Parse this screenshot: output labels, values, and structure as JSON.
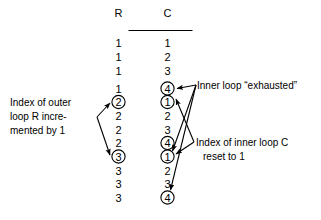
{
  "figure": {
    "table": {
      "headers": [
        "R",
        "C"
      ],
      "rows": [
        {
          "r": "1",
          "c": "1",
          "r_circled": false,
          "c_circled": false
        },
        {
          "r": "1",
          "c": "2",
          "r_circled": false,
          "c_circled": false
        },
        {
          "r": "1",
          "c": "3",
          "r_circled": false,
          "c_circled": false
        },
        {
          "r": "1",
          "c": "4",
          "r_circled": false,
          "c_circled": true
        },
        {
          "r": "2",
          "c": "1",
          "r_circled": true,
          "c_circled": true
        },
        {
          "r": "2",
          "c": "2",
          "r_circled": false,
          "c_circled": false
        },
        {
          "r": "2",
          "c": "3",
          "r_circled": false,
          "c_circled": false
        },
        {
          "r": "2",
          "c": "4",
          "r_circled": false,
          "c_circled": true
        },
        {
          "r": "3",
          "c": "1",
          "r_circled": true,
          "c_circled": true
        },
        {
          "r": "3",
          "c": "2",
          "r_circled": false,
          "c_circled": false
        },
        {
          "r": "3",
          "c": "3",
          "r_circled": false,
          "c_circled": false
        },
        {
          "r": "3",
          "c": "4",
          "r_circled": false,
          "c_circled": true
        }
      ]
    },
    "annotations": {
      "outer_loop": {
        "line1": "Index of outer",
        "line2": "loop R incre-",
        "line3": "mented by 1"
      },
      "inner_exhausted": {
        "line1": "Inner loop “exhausted”"
      },
      "inner_reset": {
        "line1": "Index of inner loop C",
        "line2": "reset to 1"
      }
    },
    "colors": {
      "ink": "#000000",
      "background": "#ffffff"
    }
  }
}
